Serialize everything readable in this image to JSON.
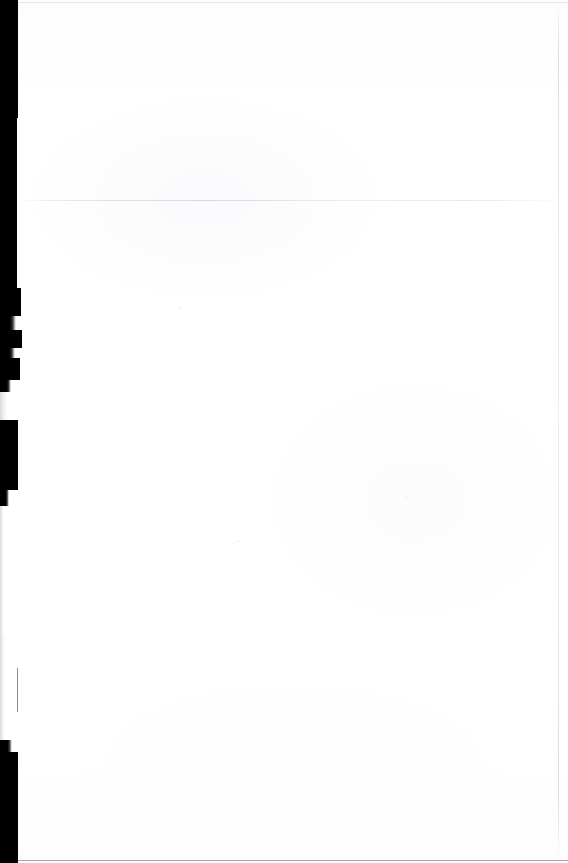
{
  "document": {
    "kind": "scanned-page",
    "page_content_text": "",
    "description": "Blank scanned document page",
    "canvas": {
      "width": 568,
      "height": 863
    }
  },
  "colors": {
    "paper": "#ffffff",
    "paper_tint": "#fdfdfe",
    "scan_shadow": "#000000",
    "scan_shadow_soft": "#3a3a3a",
    "faint_rule": "#e3e3e8",
    "bottom_rule": "#9c9ca3",
    "page_edge": "#d6d6dd",
    "scan_line": "#d6d6de"
  },
  "artifacts": {
    "left_shadow_band": {
      "name": "left-scan-shadow",
      "segments": [
        {
          "top": 0,
          "height": 118,
          "width": 18,
          "style": "solid"
        },
        {
          "top": 118,
          "height": 88,
          "width": 17,
          "style": "solid"
        },
        {
          "top": 206,
          "height": 82,
          "width": 17,
          "style": "solid"
        },
        {
          "top": 288,
          "height": 28,
          "width": 21,
          "style": "solid"
        },
        {
          "top": 316,
          "height": 14,
          "width": 16,
          "style": "soft"
        },
        {
          "top": 330,
          "height": 18,
          "width": 22,
          "style": "solid"
        },
        {
          "top": 348,
          "height": 10,
          "width": 15,
          "style": "soft"
        },
        {
          "top": 358,
          "height": 22,
          "width": 20,
          "style": "solid"
        },
        {
          "top": 380,
          "height": 12,
          "width": 11,
          "style": "soft"
        },
        {
          "top": 392,
          "height": 28,
          "width": 7,
          "style": "faint"
        },
        {
          "top": 420,
          "height": 70,
          "width": 18,
          "style": "solid"
        },
        {
          "top": 490,
          "height": 16,
          "width": 9,
          "style": "soft"
        },
        {
          "top": 506,
          "height": 130,
          "width": 4,
          "style": "faint"
        },
        {
          "top": 636,
          "height": 104,
          "width": 5,
          "style": "faint"
        },
        {
          "top": 740,
          "height": 12,
          "width": 12,
          "style": "soft"
        },
        {
          "top": 752,
          "height": 111,
          "width": 18,
          "style": "solid"
        }
      ]
    },
    "inner_hairline": {
      "name": "scan-edge-hairline",
      "left": 17,
      "top": 668,
      "width": 1,
      "height": 44
    },
    "horizontal_scan_line": {
      "name": "horizontal-scan-artifact",
      "top": 200
    },
    "top_rule": {
      "name": "page-top-rule",
      "top": 2
    },
    "bottom_rule": {
      "name": "page-bottom-rule"
    },
    "right_edge": {
      "name": "page-right-edge",
      "left": 558
    },
    "specks": [
      {
        "left": 178,
        "top": 306,
        "size": 3
      },
      {
        "left": 404,
        "top": 496,
        "size": 3
      },
      {
        "left": 445,
        "top": 517,
        "size": 2
      },
      {
        "left": 236,
        "top": 540,
        "size": 3
      },
      {
        "left": 233,
        "top": 542,
        "size": 2
      }
    ]
  }
}
